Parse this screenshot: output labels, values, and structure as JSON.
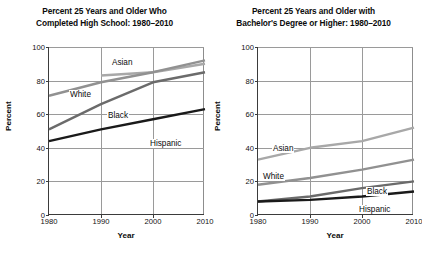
{
  "figure": {
    "axis_y_label": "Percent",
    "axis_x_label": "Year"
  },
  "charts": [
    {
      "id": "high-school",
      "title_line1": "Percent 25 Years and Older Who",
      "title_line2": "Completed High School: 1980–2010",
      "yticks": [
        "0",
        "20",
        "40",
        "60",
        "80",
        "100"
      ],
      "xticks": [
        "1980",
        "1990",
        "2000",
        "2010"
      ],
      "series_labels": [
        "Asian",
        "White",
        "Black",
        "Hispanic"
      ]
    },
    {
      "id": "bachelors",
      "title_line1": "Percent 25 Years and Older with",
      "title_line2": "Bachelor's Degree or Higher: 1980–2010",
      "yticks": [
        "0",
        "20",
        "40",
        "60",
        "80",
        "100"
      ],
      "xticks": [
        "1980",
        "1990",
        "2000",
        "2010"
      ],
      "series_labels": [
        "Asian",
        "White",
        "Black",
        "Hispanic"
      ]
    }
  ],
  "chart_data": [
    {
      "type": "line",
      "title": "Percent 25 Years and Older Who Completed High School: 1980–2010",
      "xlabel": "Year",
      "ylabel": "Percent",
      "x": [
        1980,
        1990,
        2000,
        2010
      ],
      "xlim": [
        1980,
        2010
      ],
      "ylim": [
        0,
        100
      ],
      "yticks": [
        0,
        20,
        40,
        60,
        80,
        100
      ],
      "xticks": [
        1980,
        1990,
        2000,
        2010
      ],
      "grid": true,
      "legend": "inline-labels",
      "series": [
        {
          "name": "Asian",
          "x": [
            1990,
            2000,
            2010
          ],
          "values": [
            83,
            85,
            90
          ],
          "color": "#a8a8a8"
        },
        {
          "name": "White",
          "x": [
            1980,
            1990,
            2000,
            2010
          ],
          "values": [
            71,
            79,
            85,
            92
          ],
          "color": "#919191"
        },
        {
          "name": "Black",
          "x": [
            1980,
            1990,
            2000,
            2010
          ],
          "values": [
            51,
            66,
            79,
            85
          ],
          "color": "#6b6b6b"
        },
        {
          "name": "Hispanic",
          "x": [
            1980,
            1990,
            2000,
            2010
          ],
          "values": [
            44,
            51,
            57,
            63
          ],
          "color": "#1a1a1a"
        }
      ]
    },
    {
      "type": "line",
      "title": "Percent 25 Years and Older with Bachelor's Degree or Higher: 1980–2010",
      "xlabel": "Year",
      "ylabel": "Percent",
      "x": [
        1980,
        1990,
        2000,
        2010
      ],
      "xlim": [
        1980,
        2010
      ],
      "ylim": [
        0,
        100
      ],
      "yticks": [
        0,
        20,
        40,
        60,
        80,
        100
      ],
      "xticks": [
        1980,
        1990,
        2000,
        2010
      ],
      "grid": true,
      "legend": "inline-labels",
      "series": [
        {
          "name": "Asian",
          "x": [
            1980,
            1990,
            2000,
            2010
          ],
          "values": [
            33,
            40,
            44,
            52
          ],
          "color": "#a8a8a8"
        },
        {
          "name": "White",
          "x": [
            1980,
            1990,
            2000,
            2010
          ],
          "values": [
            18,
            22,
            27,
            33
          ],
          "color": "#919191"
        },
        {
          "name": "Black",
          "x": [
            1980,
            1990,
            2000,
            2010
          ],
          "values": [
            8,
            11,
            16,
            20
          ],
          "color": "#6b6b6b"
        },
        {
          "name": "Hispanic",
          "x": [
            1980,
            1990,
            2000,
            2010
          ],
          "values": [
            8,
            9,
            11,
            14
          ],
          "color": "#1a1a1a"
        }
      ]
    }
  ],
  "label_positions": [
    [
      {
        "name": "Asian",
        "left": 62,
        "top": 11
      },
      {
        "name": "White",
        "left": 20,
        "top": 43
      },
      {
        "name": "Black",
        "left": 58,
        "top": 64
      },
      {
        "name": "Hispanic",
        "left": 100,
        "top": 92
      }
    ],
    [
      {
        "name": "Asian",
        "left": 14,
        "top": 97
      },
      {
        "name": "White",
        "left": 4,
        "top": 125
      },
      {
        "name": "Black",
        "left": 108,
        "top": 140
      },
      {
        "name": "Hispanic",
        "left": 100,
        "top": 158
      }
    ]
  ]
}
